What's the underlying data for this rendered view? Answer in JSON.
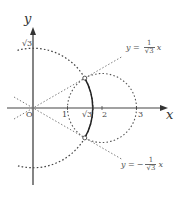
{
  "diagram": {
    "type": "complex-plane-geometry",
    "axes": {
      "x_label": "x",
      "y_label": "y",
      "origin_label": "O",
      "x_ticks": [
        "1",
        "√3",
        "2",
        "3"
      ],
      "y_ticks": [
        "√3"
      ]
    },
    "lines": [
      {
        "name": "upper-line",
        "equation_lhs": "y =",
        "sign": "",
        "numerator": "1",
        "denominator": "√3",
        "var": "x"
      },
      {
        "name": "lower-line",
        "equation_lhs": "y =",
        "sign": "−",
        "numerator": "1",
        "denominator": "√3",
        "var": "x"
      }
    ],
    "circles": [
      {
        "name": "circle-radius-sqrt3",
        "center": [
          0,
          0
        ],
        "radius": "√3",
        "style": "dotted"
      },
      {
        "name": "circle-center-2-radius-1",
        "center": [
          2,
          0
        ],
        "radius": 1,
        "style": "dotted"
      }
    ],
    "solid_arc": {
      "circle": "circle-radius-sqrt3",
      "from_angle_deg": -30,
      "to_angle_deg": 30
    },
    "intersection_points": [
      [
        1.5,
        0.866
      ],
      [
        1.5,
        -0.866
      ]
    ],
    "colors": {
      "stroke": "#333333",
      "axis": "#555555",
      "dotted": "#444444",
      "background": "#ffffff"
    }
  }
}
